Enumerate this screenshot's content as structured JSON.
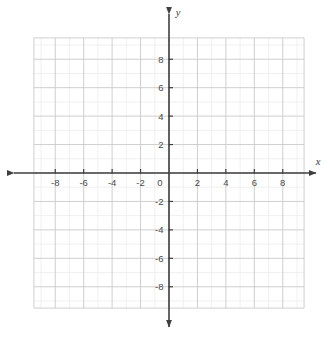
{
  "chart_data": {
    "type": "scatter",
    "title": "",
    "subtitle": "",
    "xlabel": "x",
    "ylabel": "y",
    "xlim": [
      -9.5,
      9.5
    ],
    "ylim": [
      -9.5,
      9.5
    ],
    "grid": true,
    "minor_grid_step": 1,
    "major_grid_step": 2,
    "legend": "none",
    "series": [],
    "x": [],
    "values": [],
    "annotations": [],
    "x_tick_labels": [
      "-8",
      "-6",
      "-4",
      "-2",
      "0",
      "2",
      "4",
      "6",
      "8"
    ],
    "x_tick_values": [
      -8,
      -6,
      -4,
      -2,
      0,
      2,
      4,
      6,
      8
    ],
    "y_tick_labels": [
      "8",
      "6",
      "4",
      "2",
      "-2",
      "-4",
      "-6",
      "-8"
    ],
    "y_tick_values": [
      8,
      6,
      4,
      2,
      -2,
      -4,
      -6,
      -8
    ],
    "origin_label": "0"
  },
  "axes": {
    "x_axis_name": "x",
    "y_axis_name": "y",
    "origin_label": "0"
  },
  "colors": {
    "background": "#ffffff",
    "minor_grid": "#ececec",
    "major_grid": "#c9c9c9",
    "axis": "#3f3f3f",
    "tick_text": "#4a4a4a",
    "axis_name": "#3a3a3a"
  }
}
